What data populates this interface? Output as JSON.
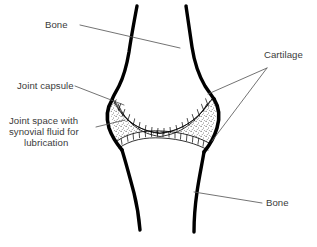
{
  "figure": {
    "background_color": "#ffffff",
    "ink_color": "#000000",
    "label_color": "#3b3b3b",
    "leader_color": "#5a5a5a"
  },
  "labels": {
    "bone_top": "Bone",
    "bone_bottom": "Bone",
    "cartilage": "Cartilage",
    "joint_capsule": "Joint capsule",
    "joint_space_line1": "Joint space with",
    "joint_space_line2": "synovial fluid for",
    "joint_space_line3": "lubrication"
  },
  "parts": [
    {
      "name": "upper-bone",
      "label": "Bone",
      "description": "Upper long bone shaft with widened condyle end"
    },
    {
      "name": "lower-bone",
      "label": "Bone",
      "description": "Lower long bone shaft"
    },
    {
      "name": "cartilage-upper",
      "label": "Cartilage",
      "description": "Hatched cartilage band on upper bone surface"
    },
    {
      "name": "cartilage-lower",
      "label": "Cartilage",
      "description": "Hatched cartilage band on lower bone surface"
    },
    {
      "name": "joint-capsule",
      "label": "Joint capsule",
      "description": "Thick outline enclosing the joint"
    },
    {
      "name": "joint-space",
      "label": "Joint space with synovial fluid for lubrication",
      "description": "Stippled cavity between cartilage layers"
    }
  ]
}
